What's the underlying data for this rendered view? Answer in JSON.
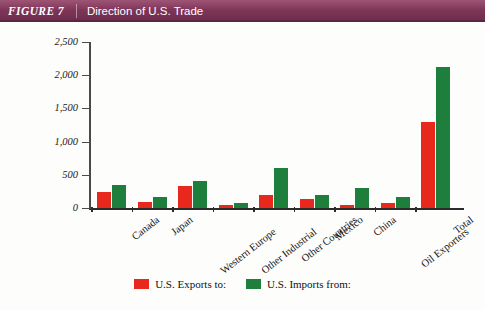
{
  "header": {
    "figure_number": "FIGURE 7",
    "title": "Direction of U.S. Trade"
  },
  "colors": {
    "header_band": "#7e3558",
    "exports": "#e8281c",
    "imports": "#1e7f3c",
    "axis": "#2b2b2b"
  },
  "legend": {
    "position": "bottom-center",
    "entries": [
      {
        "label": "U.S. Exports to:",
        "color": "#e8281c",
        "swatch": "exports"
      },
      {
        "label": "U.S. Imports from:",
        "color": "#1e7f3c",
        "swatch": "imports"
      }
    ]
  },
  "axis": {
    "y_ticks": [
      "2,500",
      "2,000",
      "1,500",
      "1,000",
      "500",
      "0"
    ],
    "y_tick_values": [
      2500,
      2000,
      1500,
      1000,
      500,
      0
    ]
  },
  "chart_data": {
    "type": "bar",
    "title": "Direction of U.S. Trade",
    "xlabel": "",
    "ylabel": "",
    "ylim": [
      0,
      2500
    ],
    "ytick_labels": [
      "0",
      "500",
      "1,000",
      "1,500",
      "2,000",
      "2,500"
    ],
    "grid": false,
    "legend_position": "bottom-center",
    "categories": [
      "Canada",
      "Japan",
      "Western Europe",
      "Other Industrial",
      "Other Countries",
      "Mexico",
      "China",
      "Oil Exporters",
      "Total"
    ],
    "series": [
      {
        "name": "U.S. Exports to:",
        "color": "#e8281c",
        "values": [
          240,
          90,
          330,
          50,
          195,
          140,
          45,
          70,
          1290
        ]
      },
      {
        "name": "U.S. Imports from:",
        "color": "#1e7f3c",
        "values": [
          340,
          165,
          400,
          75,
          600,
          190,
          300,
          160,
          2125
        ]
      }
    ]
  }
}
